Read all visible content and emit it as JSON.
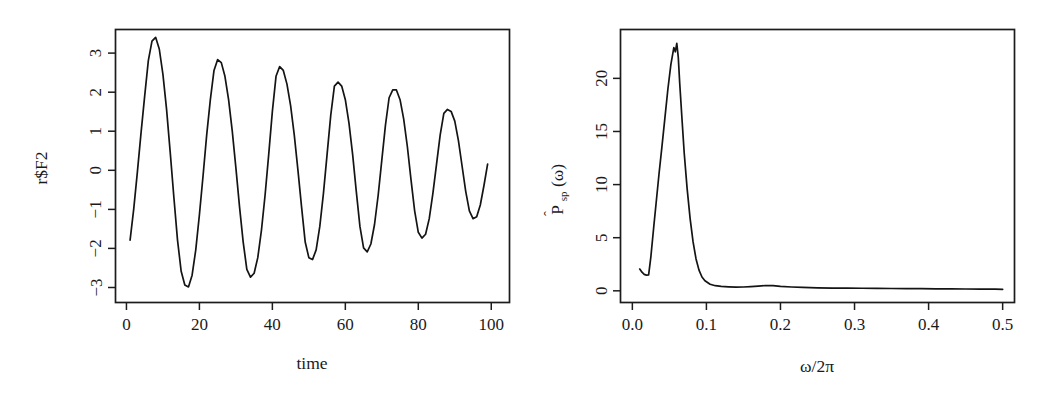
{
  "figure": {
    "background": "#ffffff",
    "line_color": "#141414",
    "axis_color": "#1c1c1c",
    "panel_count": 2
  },
  "chart_data": [
    {
      "type": "line",
      "panel": "left",
      "title": "",
      "xlabel": "time",
      "ylabel": "r$F2",
      "xlim": [
        -3,
        105
      ],
      "ylim": [
        -3.45,
        3.55
      ],
      "xticks": [
        0,
        20,
        40,
        60,
        80,
        100
      ],
      "xticklabels": [
        "0",
        "20",
        "40",
        "60",
        "80",
        "100"
      ],
      "yticks": [
        -3,
        -2,
        -1,
        0,
        1,
        2,
        3
      ],
      "yticklabels": [
        "-3",
        "-2",
        "-1",
        "0",
        "1",
        "2",
        "3"
      ],
      "grid": false,
      "legend": null,
      "description": "Damped sinusoidal time series, period approximately 16.4 time units, amplitude decaying from about 3.35 to about 1.5",
      "x": [
        1,
        2,
        3,
        4,
        5,
        6,
        7,
        8,
        9,
        10,
        11,
        12,
        13,
        14,
        15,
        16,
        17,
        18,
        19,
        20,
        21,
        22,
        23,
        24,
        25,
        26,
        27,
        28,
        29,
        30,
        31,
        32,
        33,
        34,
        35,
        36,
        37,
        38,
        39,
        40,
        41,
        42,
        43,
        44,
        45,
        46,
        47,
        48,
        49,
        50,
        51,
        52,
        53,
        54,
        55,
        56,
        57,
        58,
        59,
        60,
        61,
        62,
        63,
        64,
        65,
        66,
        67,
        68,
        69,
        70,
        71,
        72,
        73,
        74,
        75,
        76,
        77,
        78,
        79,
        80,
        81,
        82,
        83,
        84,
        85,
        86,
        87,
        88,
        89,
        90,
        91,
        92,
        93,
        94,
        95,
        96,
        97,
        98,
        99,
        100,
        101
      ],
      "y": [
        -1.85,
        -1.05,
        -0.1,
        0.9,
        1.85,
        2.75,
        3.25,
        3.35,
        3.05,
        2.4,
        1.5,
        0.4,
        -0.75,
        -1.85,
        -2.65,
        -3.0,
        -3.05,
        -2.75,
        -2.1,
        -1.2,
        -0.2,
        0.85,
        1.75,
        2.5,
        2.78,
        2.7,
        2.35,
        1.75,
        0.95,
        0.0,
        -1.0,
        -1.9,
        -2.6,
        -2.8,
        -2.7,
        -2.3,
        -1.6,
        -0.7,
        0.35,
        1.45,
        2.35,
        2.6,
        2.5,
        2.15,
        1.6,
        0.85,
        -0.05,
        -1.0,
        -1.9,
        -2.3,
        -2.35,
        -2.1,
        -1.5,
        -0.65,
        0.35,
        1.35,
        2.1,
        2.2,
        2.1,
        1.75,
        1.15,
        0.35,
        -0.6,
        -1.5,
        -2.05,
        -2.15,
        -1.95,
        -1.45,
        -0.7,
        0.2,
        1.1,
        1.8,
        2.0,
        2.0,
        1.75,
        1.25,
        0.55,
        -0.3,
        -1.1,
        -1.65,
        -1.8,
        -1.7,
        -1.3,
        -0.65,
        0.1,
        0.85,
        1.4,
        1.5,
        1.45,
        1.2,
        0.7,
        0.05,
        -0.6,
        -1.1,
        -1.3,
        -1.25,
        -0.95,
        -0.45,
        0.1
      ]
    },
    {
      "type": "line",
      "panel": "right",
      "title": "",
      "xlabel": "w/2p",
      "ylabel": "P_sp(w)",
      "xlim": [
        -0.016,
        0.516
      ],
      "ylim": [
        -1.1,
        24.6
      ],
      "xticks": [
        0.0,
        0.1,
        0.2,
        0.3,
        0.4,
        0.5
      ],
      "xticklabels": [
        "0.0",
        "0.1",
        "0.2",
        "0.3",
        "0.4",
        "0.5"
      ],
      "yticks": [
        0,
        5,
        10,
        15,
        20
      ],
      "yticklabels": [
        "0",
        "5",
        "10",
        "15",
        "20"
      ],
      "grid": false,
      "legend": null,
      "description": "Estimated smoothed spectral density with a single sharp peak near frequency 0.060 reaching about 23.3, then decaying to near zero beyond 0.10",
      "x": [
        0.01,
        0.013,
        0.016,
        0.019,
        0.022,
        0.025,
        0.029,
        0.032,
        0.036,
        0.04,
        0.044,
        0.048,
        0.052,
        0.056,
        0.058,
        0.06,
        0.062,
        0.064,
        0.067,
        0.07,
        0.074,
        0.078,
        0.082,
        0.086,
        0.09,
        0.094,
        0.098,
        0.105,
        0.112,
        0.12,
        0.13,
        0.14,
        0.15,
        0.16,
        0.17,
        0.18,
        0.19,
        0.2,
        0.215,
        0.23,
        0.25,
        0.27,
        0.29,
        0.31,
        0.33,
        0.35,
        0.37,
        0.39,
        0.41,
        0.43,
        0.45,
        0.47,
        0.49,
        0.5
      ],
      "y": [
        2.05,
        1.75,
        1.55,
        1.48,
        1.5,
        3.2,
        6.1,
        8.2,
        11.0,
        13.6,
        16.3,
        19.0,
        21.3,
        22.9,
        22.5,
        23.3,
        22.0,
        19.5,
        16.2,
        13.0,
        9.6,
        6.8,
        4.6,
        3.0,
        1.95,
        1.3,
        0.95,
        0.62,
        0.48,
        0.42,
        0.38,
        0.35,
        0.36,
        0.4,
        0.45,
        0.5,
        0.48,
        0.42,
        0.36,
        0.32,
        0.28,
        0.26,
        0.25,
        0.24,
        0.23,
        0.22,
        0.21,
        0.2,
        0.19,
        0.18,
        0.17,
        0.16,
        0.15,
        0.14
      ]
    }
  ],
  "panel_left": {
    "ylabel": "r$F2",
    "xlabel": "time",
    "xticklabels": [
      "0",
      "20",
      "40",
      "60",
      "80",
      "100"
    ],
    "yticklabels": [
      "−3",
      "−2",
      "−1",
      "0",
      "1",
      "2",
      "3"
    ]
  },
  "panel_right": {
    "ylabel_main": "P",
    "ylabel_sub": "sp",
    "ylabel_arg": "(ω)",
    "ylabel_hat": "ˆ",
    "xlabel": "ω/2π",
    "xticklabels": [
      "0.0",
      "0.1",
      "0.2",
      "0.3",
      "0.4",
      "0.5"
    ],
    "yticklabels": [
      "0",
      "5",
      "10",
      "15",
      "20"
    ]
  }
}
